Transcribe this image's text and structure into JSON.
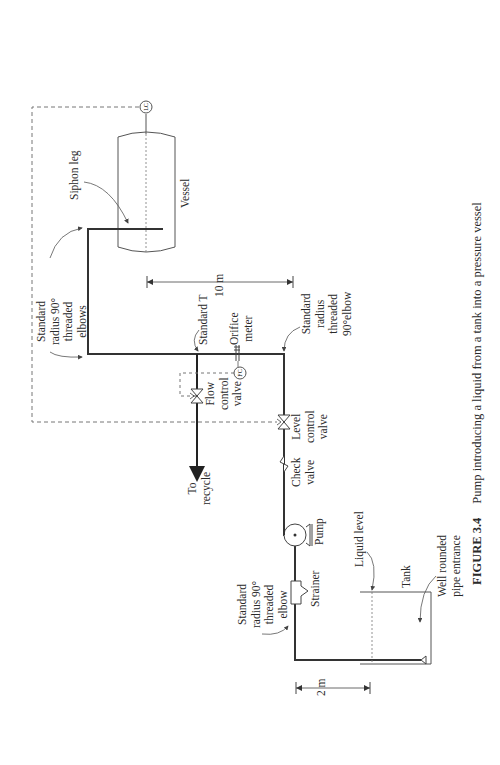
{
  "figure": {
    "number": "FIGURE 3.4",
    "caption": "Pump introducing a liquid from a tank into a pressure vessel"
  },
  "labels": {
    "siphon_leg": "Siphon leg",
    "vessel": "Vessel",
    "lc": "LC",
    "fc": "FC",
    "elbows_top": "Standard\nradius 90°\nthreaded\nelbows",
    "standard_t": "Standard T",
    "orifice_meter": "Orifice\nmeter",
    "elbow_right": "Standard\nradius\nthreaded\n90°elbow",
    "dim_10m": "10 m",
    "flow_control_valve": "Flow\ncontrol\nvalve",
    "level_control_valve": "Level\ncontrol\nvalve",
    "check_valve": "Check\nvalve",
    "to_recycle": "To\nrecycle",
    "pump": "Pump",
    "strainer": "Strainer",
    "elbow_bottom": "Standard\nradius 90°\nthreaded\nelbow",
    "liquid_level": "Liquid level",
    "tank": "Tank",
    "pipe_entrance": "Well rounded\npipe entrance",
    "dim_2m": "2 m"
  },
  "colors": {
    "pipe": "#333333",
    "line": "#555555",
    "dashed": "#777777"
  }
}
